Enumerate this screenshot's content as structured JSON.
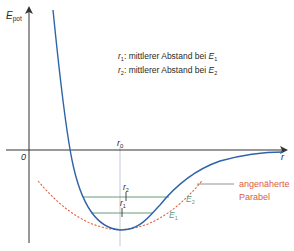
{
  "diagram": {
    "y_axis_label": "E",
    "y_axis_label_sub": "pot",
    "x_axis_label": "r",
    "origin_label": "0",
    "r0_label": "r",
    "r0_sub": "0",
    "legend": [
      {
        "sym": "r",
        "sub": "1",
        "text": ": mittlerer Abstand bei ",
        "e": "E",
        "esub": "1"
      },
      {
        "sym": "r",
        "sub": "2",
        "text": ": mittlerer Abstand bei ",
        "e": "E",
        "esub": "2"
      }
    ],
    "levels": [
      {
        "r_label": "r",
        "r_sub": "1",
        "e_label": "E",
        "e_sub": "1"
      },
      {
        "r_label": "r",
        "r_sub": "2",
        "e_label": "E",
        "e_sub": "2"
      }
    ],
    "parabola_label_line1": "angenäherte",
    "parabola_label_line2": "Parabel",
    "colors": {
      "potential_curve": "#2f63a8",
      "parabola": "#e0664a",
      "energy_levels": "#5a8f6a",
      "energy_labels": "#5aa07a",
      "parabola_label": "#d9603f",
      "axes": "#333333",
      "r0_line": "#9aa3ad"
    }
  }
}
